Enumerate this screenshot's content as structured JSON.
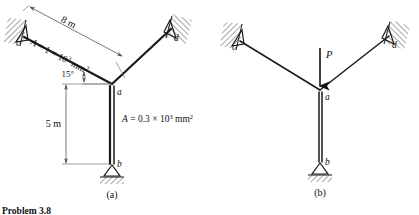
{
  "caption": "Problem 3.8",
  "panels": [
    {
      "key": "a",
      "label": "(a)",
      "nodes": {
        "c": "c",
        "d": "d",
        "a": "a",
        "b": "b"
      },
      "dimensions": {
        "span": "8 m",
        "height": "5 m",
        "angle": "15°"
      },
      "areas": {
        "inclined_prefix": "A",
        "inclined_eq": " = 1 × 10",
        "inclined_exp": "3",
        "inclined_unit": " mm",
        "inclined_unit_exp": "2",
        "column_prefix": "A",
        "column_eq": " = 0.3 × 10",
        "column_exp": "3",
        "column_unit": " mm",
        "column_unit_exp": "2"
      }
    },
    {
      "key": "b",
      "label": "(b)",
      "nodes": {
        "c": "c",
        "d": "d",
        "a": "a",
        "b": "b"
      },
      "load": {
        "symbol": "P"
      }
    }
  ],
  "colors": {
    "member": "#1a1a1a",
    "dimension": "#555555",
    "hatch": "#3a3a3a",
    "text": "#111111",
    "background": "#ffffff"
  }
}
